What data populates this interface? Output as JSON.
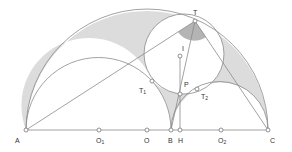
{
  "diagram": {
    "type": "arbelos geometry construction",
    "colors": {
      "stroke": "#8a8a8a",
      "shade_light": "#dcdcdc",
      "shade_dark": "#b4b4b4",
      "point_fill": "#ffffff",
      "label": "#333333"
    },
    "points": [
      {
        "id": "A",
        "label": "A",
        "sub": "",
        "x": 26,
        "y": 130,
        "lx": 15,
        "ly": 137
      },
      {
        "id": "O1",
        "label": "O",
        "sub": "1",
        "x": 99,
        "y": 130,
        "lx": 96,
        "ly": 137
      },
      {
        "id": "O",
        "label": "O",
        "sub": "",
        "x": 147,
        "y": 130,
        "lx": 144,
        "ly": 137
      },
      {
        "id": "B",
        "label": "B",
        "sub": "",
        "x": 171,
        "y": 130,
        "lx": 168,
        "ly": 137
      },
      {
        "id": "H",
        "label": "H",
        "sub": "",
        "x": 180,
        "y": 130,
        "lx": 178,
        "ly": 137
      },
      {
        "id": "O2",
        "label": "O",
        "sub": "2",
        "x": 221,
        "y": 130,
        "lx": 218,
        "ly": 137
      },
      {
        "id": "C",
        "label": "C",
        "sub": "",
        "x": 268,
        "y": 130,
        "lx": 270,
        "ly": 137
      },
      {
        "id": "T",
        "label": "T",
        "sub": "",
        "x": 195,
        "y": 21,
        "lx": 193,
        "ly": 9
      },
      {
        "id": "I",
        "label": "I",
        "sub": "",
        "x": 179,
        "y": 56,
        "lx": 182,
        "ly": 45
      },
      {
        "id": "P",
        "label": "P",
        "sub": "",
        "x": 180,
        "y": 94,
        "lx": 184,
        "ly": 81
      },
      {
        "id": "T1",
        "label": "T",
        "sub": "1",
        "x": 152,
        "y": 81,
        "lx": 139,
        "ly": 87
      },
      {
        "id": "T2",
        "label": "T",
        "sub": "2",
        "x": 197,
        "y": 89,
        "lx": 201,
        "ly": 93
      }
    ]
  }
}
